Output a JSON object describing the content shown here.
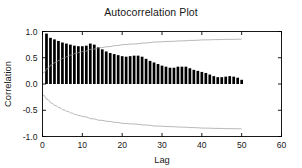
{
  "chart_data": {
    "type": "bar",
    "title": "Autocorrelation Plot",
    "xlabel": "Lag",
    "ylabel": "Correlation",
    "xlim": [
      0,
      60
    ],
    "ylim": [
      -1.0,
      1.0
    ],
    "grid": false,
    "legend": "none",
    "xticks": [
      0,
      10,
      20,
      30,
      40,
      50,
      60
    ],
    "xtick_labels": [
      "0",
      "10",
      "20",
      "30",
      "40",
      "50",
      "60"
    ],
    "yticks": [
      1.0,
      0.5,
      0.0,
      -0.5,
      -1.0
    ],
    "ytick_labels": [
      "1.0",
      "0.5",
      "0.0",
      "-0.5",
      "-1.0"
    ],
    "x": [
      1,
      2,
      3,
      4,
      5,
      6,
      7,
      8,
      9,
      10,
      11,
      12,
      13,
      14,
      15,
      16,
      17,
      18,
      19,
      20,
      21,
      22,
      23,
      24,
      25,
      26,
      27,
      28,
      29,
      30,
      31,
      32,
      33,
      34,
      35,
      36,
      37,
      38,
      39,
      40,
      41,
      42,
      43,
      44,
      45,
      46,
      47,
      48,
      49,
      50
    ],
    "values": [
      0.96,
      0.88,
      0.85,
      0.82,
      0.79,
      0.77,
      0.75,
      0.73,
      0.72,
      0.72,
      0.73,
      0.77,
      0.75,
      0.7,
      0.66,
      0.62,
      0.59,
      0.57,
      0.55,
      0.53,
      0.52,
      0.53,
      0.54,
      0.54,
      0.52,
      0.48,
      0.44,
      0.41,
      0.38,
      0.35,
      0.33,
      0.31,
      0.31,
      0.33,
      0.33,
      0.33,
      0.3,
      0.27,
      0.25,
      0.23,
      0.21,
      0.18,
      0.15,
      0.13,
      0.13,
      0.14,
      0.15,
      0.14,
      0.12,
      0.08
    ],
    "series": [
      {
        "name": "autocorrelation",
        "kind": "bar",
        "color": "#000000",
        "values": [
          0.96,
          0.88,
          0.85,
          0.82,
          0.79,
          0.77,
          0.75,
          0.73,
          0.72,
          0.72,
          0.73,
          0.77,
          0.75,
          0.7,
          0.66,
          0.62,
          0.59,
          0.57,
          0.55,
          0.53,
          0.52,
          0.53,
          0.54,
          0.54,
          0.52,
          0.48,
          0.44,
          0.41,
          0.38,
          0.35,
          0.33,
          0.31,
          0.31,
          0.33,
          0.33,
          0.33,
          0.3,
          0.27,
          0.25,
          0.23,
          0.21,
          0.18,
          0.15,
          0.13,
          0.13,
          0.14,
          0.15,
          0.14,
          0.12,
          0.08
        ]
      },
      {
        "name": "upper-confidence-band",
        "kind": "line",
        "color": "#9a9a9a",
        "x": [
          0,
          1,
          2,
          3,
          4,
          5,
          6,
          7,
          8,
          9,
          10,
          12,
          14,
          16,
          18,
          20,
          22,
          25,
          28,
          31,
          34,
          37,
          40,
          43,
          46,
          50
        ],
        "values": [
          0.21,
          0.29,
          0.36,
          0.41,
          0.45,
          0.49,
          0.52,
          0.55,
          0.58,
          0.6,
          0.62,
          0.66,
          0.69,
          0.71,
          0.73,
          0.75,
          0.76,
          0.78,
          0.8,
          0.81,
          0.82,
          0.83,
          0.84,
          0.845,
          0.85,
          0.855
        ]
      },
      {
        "name": "lower-confidence-band",
        "kind": "line",
        "color": "#9a9a9a",
        "x": [
          0,
          1,
          2,
          3,
          4,
          5,
          6,
          7,
          8,
          9,
          10,
          12,
          14,
          16,
          18,
          20,
          22,
          25,
          28,
          31,
          34,
          37,
          40,
          43,
          46,
          50
        ],
        "values": [
          -0.21,
          -0.29,
          -0.36,
          -0.41,
          -0.45,
          -0.49,
          -0.52,
          -0.55,
          -0.58,
          -0.6,
          -0.62,
          -0.66,
          -0.69,
          -0.71,
          -0.73,
          -0.75,
          -0.76,
          -0.78,
          -0.8,
          -0.81,
          -0.82,
          -0.83,
          -0.84,
          -0.845,
          -0.85,
          -0.855
        ]
      }
    ]
  },
  "figure": {
    "background": "#ffffff",
    "bar_color": "#000000",
    "band_color": "#9a9a9a",
    "axis_color": "#000000"
  }
}
